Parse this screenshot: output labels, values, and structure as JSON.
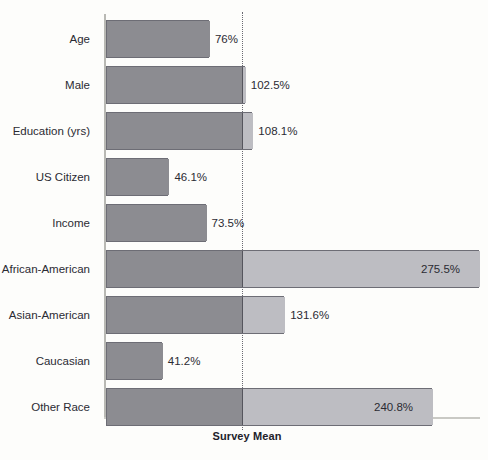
{
  "chart_data": {
    "type": "bar",
    "orientation": "horizontal",
    "title": "",
    "xlabel": "Survey Mean",
    "ylabel": "",
    "categories": [
      "Age",
      "Male",
      "Education (yrs)",
      "US Citizen",
      "Income",
      "African-American",
      "Asian-American",
      "Caucasian",
      "Other Race"
    ],
    "values": [
      76,
      102.5,
      108.1,
      46.1,
      73.5,
      275.5,
      131.6,
      41.2,
      240.8
    ],
    "value_labels": [
      "76%",
      "102.5%",
      "108.1%",
      "46.1%",
      "73.5%",
      "275.5%",
      "131.6%",
      "41.2%",
      "240.8%"
    ],
    "unit": "%",
    "reference_line": {
      "value": 100,
      "style": "dotted",
      "label": ""
    },
    "xlim": [
      0,
      280
    ],
    "grid": false,
    "legend": null,
    "colors": {
      "bar_below_reference": "#8c8c91",
      "bar_above_reference": "#bdbdc2",
      "bar_outline": "#6d6d75",
      "reference_line": "#6a6a72",
      "axis": "#b9b9b4",
      "text": "#2b2b33",
      "background": "#fdfdfb"
    }
  }
}
